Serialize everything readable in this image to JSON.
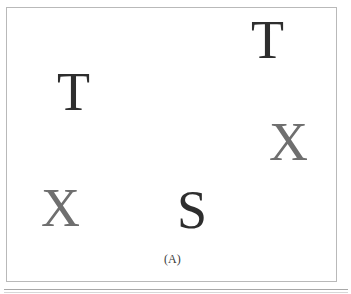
{
  "figure": {
    "caption": "(A)",
    "caption_x": 163,
    "caption_y": 252,
    "panel": {
      "border_color": "#b9b9b9",
      "background": "#ffffff"
    },
    "colors": {
      "dark_letter": "#2e2e2e",
      "gray_letter": "#6f6f6f",
      "caption": "#3a3a3a",
      "rule": "#a8a8a8"
    },
    "stimuli": [
      {
        "id": "letter-t-top-right",
        "char": "T",
        "x": 250,
        "y": 12,
        "size": 54,
        "color": "#2e2e2e",
        "role": "target"
      },
      {
        "id": "letter-t-left",
        "char": "T",
        "x": 56,
        "y": 64,
        "size": 54,
        "color": "#2e2e2e",
        "role": "target"
      },
      {
        "id": "letter-x-right",
        "char": "X",
        "x": 268,
        "y": 114,
        "size": 54,
        "color": "#6f6f6f",
        "role": "distractor"
      },
      {
        "id": "letter-x-bottom-left",
        "char": "X",
        "x": 40,
        "y": 180,
        "size": 54,
        "color": "#6f6f6f",
        "role": "distractor"
      },
      {
        "id": "letter-s-bottom-center",
        "char": "S",
        "x": 176,
        "y": 182,
        "size": 54,
        "color": "#2e2e2e",
        "role": "target"
      }
    ]
  }
}
